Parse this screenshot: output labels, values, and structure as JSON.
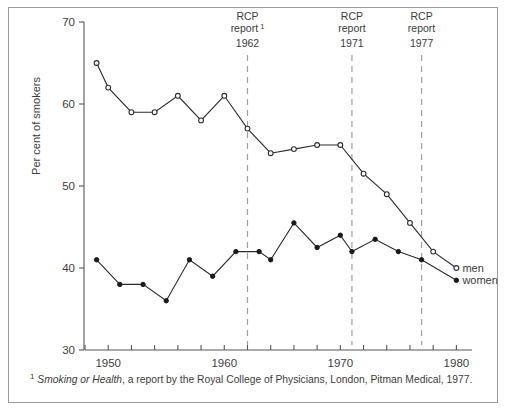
{
  "chart_data": {
    "type": "line",
    "title": "",
    "subtitle": "",
    "xlabel": "",
    "ylabel": "Per cent of smokers",
    "xlim": [
      1948,
      1981
    ],
    "ylim": [
      30,
      70
    ],
    "yticks": [
      30,
      40,
      50,
      60,
      70
    ],
    "ytick_labels": [
      "30",
      "40",
      "50",
      "60",
      "70"
    ],
    "xticks": [
      1950,
      1960,
      1970,
      1980
    ],
    "xtick_labels": [
      "1950",
      "1960",
      "1970",
      "1980"
    ],
    "x_minor_tick_interval": 2,
    "grid": false,
    "legend_position": "right-inside-end-of-lines",
    "series": [
      {
        "name": "men",
        "marker": "open-circle",
        "x": [
          1949,
          1950,
          1952,
          1954,
          1956,
          1958,
          1960,
          1962,
          1964,
          1966,
          1968,
          1970,
          1972,
          1974,
          1976,
          1978,
          1980
        ],
        "values": [
          65,
          62,
          59,
          59,
          61,
          58,
          61,
          57,
          54,
          54.5,
          55,
          55,
          51.5,
          49,
          45.5,
          42,
          40
        ]
      },
      {
        "name": "women",
        "marker": "filled-circle",
        "x": [
          1949,
          1951,
          1953,
          1955,
          1957,
          1959,
          1961,
          1963,
          1964,
          1966,
          1968,
          1970,
          1971,
          1973,
          1975,
          1977,
          1980
        ],
        "values": [
          41,
          38,
          38,
          36,
          41,
          39,
          42,
          42,
          41,
          45.5,
          42.5,
          44,
          42,
          43.5,
          42,
          41,
          38.5
        ]
      }
    ],
    "annotations": [
      {
        "x": 1962,
        "line1": "RCP",
        "line2": "report",
        "footnote_marker": "1",
        "year": "1962"
      },
      {
        "x": 1971,
        "line1": "RCP",
        "line2": "report",
        "footnote_marker": "",
        "year": "1971"
      },
      {
        "x": 1977,
        "line1": "RCP",
        "line2": "report",
        "footnote_marker": "",
        "year": "1977"
      }
    ]
  },
  "footnote": {
    "marker": "1",
    "italic_part": "Smoking or Health",
    "rest": ", a report by the Royal College of Physicians, London, Pitman Medical, 1977."
  },
  "colors": {
    "axis": "#55565a",
    "series": "#2b2b2b",
    "reference_line": "#9aa0a6",
    "frame": "#9a9a9a",
    "text": "#3c3c3c",
    "background": "#ffffff"
  }
}
